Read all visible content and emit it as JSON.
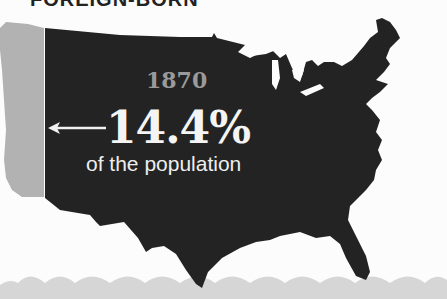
{
  "heading": {
    "text": "FOREIGN-BORN"
  },
  "map": {
    "region": "United States",
    "highlight_color": "#232323",
    "west_region_color": "#b0b0b0",
    "water_color": "#d4d4d4",
    "background_color": "#fcfcfc"
  },
  "stat": {
    "year": "1870",
    "value": "14.4%",
    "caption": "of the population",
    "arrow": "left-arrow"
  }
}
